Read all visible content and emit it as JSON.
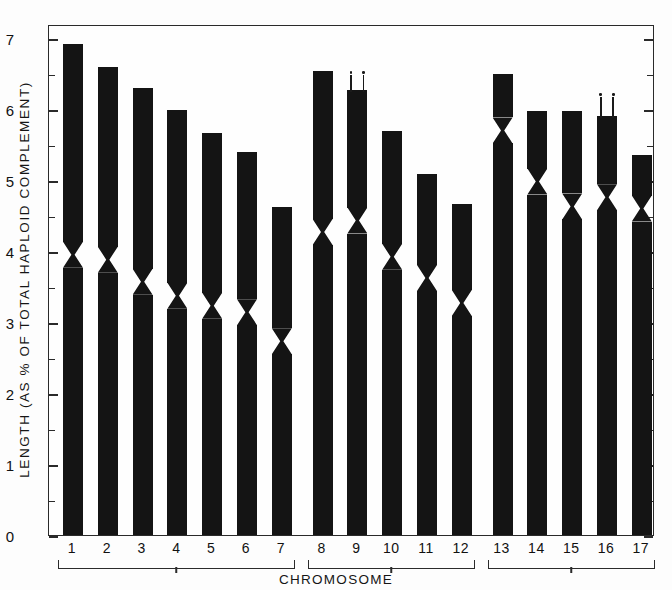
{
  "chart_data": {
    "type": "bar",
    "title": "",
    "xlabel": "CHROMOSOME",
    "ylabel": "LENGTH (AS % OF TOTAL HAPLOID COMPLEMENT)",
    "ylim": [
      0,
      7.2
    ],
    "ytick_labels": [
      "0",
      "1",
      "2",
      "3",
      "4",
      "5",
      "6",
      "7"
    ],
    "ytick_values": [
      0,
      1,
      2,
      3,
      4,
      5,
      6,
      7
    ],
    "yminor_step": 0.5,
    "grid": false,
    "legend": null,
    "categories": [
      "1",
      "2",
      "3",
      "4",
      "5",
      "6",
      "7",
      "8",
      "9",
      "10",
      "11",
      "12",
      "13",
      "14",
      "15",
      "16",
      "17"
    ],
    "values": [
      6.92,
      6.6,
      6.3,
      5.99,
      5.66,
      5.39,
      4.62,
      6.54,
      6.27,
      5.69,
      5.08,
      4.67,
      6.5,
      5.98,
      5.97,
      5.9,
      5.36
    ],
    "centromere_positions": [
      3.95,
      3.88,
      3.57,
      3.37,
      3.23,
      3.14,
      2.73,
      4.27,
      4.43,
      3.92,
      3.62,
      3.27,
      5.7,
      4.98,
      4.63,
      4.76,
      4.6
    ],
    "error_bars": [
      {
        "category": "9",
        "top": 6.56,
        "bottom": 6.27
      },
      {
        "category": "16",
        "top": 6.25,
        "bottom": 5.9
      }
    ],
    "groups": [
      {
        "label": "",
        "from": "1",
        "to": "7"
      },
      {
        "label": "",
        "from": "8",
        "to": "12"
      },
      {
        "label": "",
        "from": "13",
        "to": "17"
      }
    ],
    "bar_color": "#141414",
    "axis_color": "#2a2a2a"
  },
  "axis": {
    "y_title": "LENGTH (AS % OF TOTAL HAPLOID COMPLEMENT)",
    "x_title": "CHROMOSOME"
  }
}
